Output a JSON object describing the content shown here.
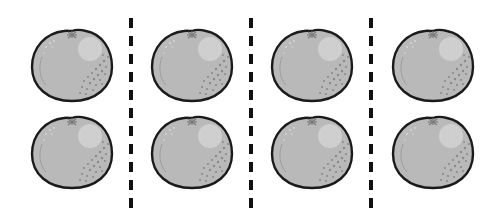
{
  "scene": {
    "description": "Eight grayscale oranges arranged in 4 columns and 2 rows, separated by dashed vertical lines",
    "columns": 4,
    "rows": 2,
    "orange_count": 8,
    "groups": [
      {
        "column": 1,
        "count": 2
      },
      {
        "column": 2,
        "count": 2
      },
      {
        "column": 3,
        "count": 2
      },
      {
        "column": 4,
        "count": 2
      }
    ],
    "colors": {
      "background": "#ffffff",
      "orange_fill": "#b9b9b9",
      "orange_outline": "#1a1a1a",
      "highlight": "#d6d6d6",
      "spots": "#8a8a8a",
      "divider": "#111111"
    },
    "divider_x": [
      131,
      251,
      371
    ],
    "orange_positions": [
      {
        "x": 30,
        "y": 27
      },
      {
        "x": 30,
        "y": 114
      },
      {
        "x": 150,
        "y": 27
      },
      {
        "x": 150,
        "y": 114
      },
      {
        "x": 270,
        "y": 27
      },
      {
        "x": 270,
        "y": 114
      },
      {
        "x": 391,
        "y": 27
      },
      {
        "x": 391,
        "y": 114
      }
    ]
  }
}
